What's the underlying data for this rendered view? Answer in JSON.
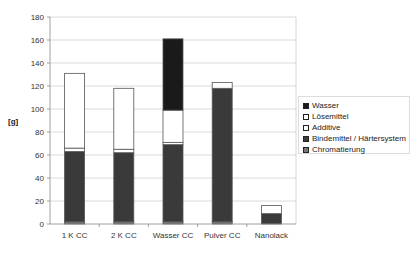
{
  "chart_data": {
    "type": "bar",
    "stacked": true,
    "title": "",
    "xlabel": "",
    "ylabel": "[g]",
    "ylim": [
      0,
      180
    ],
    "yticks": [
      0,
      20,
      40,
      60,
      80,
      100,
      120,
      140,
      160,
      180
    ],
    "grid": true,
    "legend_position": "right",
    "categories": [
      "1 K CC",
      "2 K CC",
      "Wasser CC",
      "Pulver CC",
      "Nanolack"
    ],
    "series": [
      {
        "name": "Chromatierung",
        "color": "#777777",
        "values": [
          2,
          2,
          2,
          2,
          0
        ]
      },
      {
        "name": "Bindemittel / Härtersystem",
        "color": "#3a3a3a",
        "values": [
          61,
          60,
          67,
          116,
          9
        ]
      },
      {
        "name": "Additive",
        "color": "#ffffff",
        "values": [
          3,
          3,
          2,
          0,
          0
        ]
      },
      {
        "name": "Lösemittel",
        "color": "#ffffff",
        "values": [
          65,
          53,
          28,
          5,
          7
        ]
      },
      {
        "name": "Wasser",
        "color": "#1a1a1a",
        "values": [
          0,
          0,
          62,
          0,
          0
        ]
      }
    ],
    "totals": [
      131,
      118,
      161,
      123,
      16
    ]
  },
  "legend": {
    "items": [
      {
        "label": "Wasser",
        "color": "#1a1a1a"
      },
      {
        "label": "Lösemittel",
        "color": "#ffffff"
      },
      {
        "label": "Additive",
        "color": "#ffffff"
      },
      {
        "label": "Bindemittel / Härtersystem",
        "color": "#3a3a3a"
      },
      {
        "label": "Chromatierung",
        "color": "#777777"
      }
    ]
  }
}
